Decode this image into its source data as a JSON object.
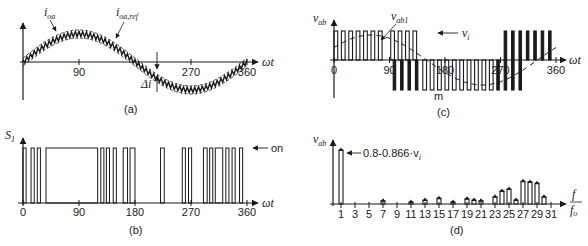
{
  "figure": {
    "panels": [
      {
        "id": "a",
        "caption": "(a)"
      },
      {
        "id": "b",
        "caption": "(b)"
      },
      {
        "id": "c",
        "caption": "(c)"
      },
      {
        "id": "d",
        "caption": "(d)"
      }
    ]
  },
  "chart_data": [
    {
      "panel": "a",
      "type": "line",
      "title": "",
      "caption": "(a)",
      "xlabel": "ωt",
      "ylabel": "",
      "xticks": [
        "90",
        "270",
        "360"
      ],
      "xtick_values": [
        90,
        270,
        360
      ],
      "xlim": [
        0,
        360
      ],
      "series": [
        {
          "name": "i_oa",
          "label_main": "i",
          "label_sub": "oa",
          "style": "solid-ripple",
          "description": "actual current with hysteresis ripple following sinusoidal reference"
        },
        {
          "name": "i_oa,ref",
          "label_main": "i",
          "label_sub": "oa,ref",
          "style": "dashed-band",
          "description": "sinusoidal reference with upper/lower hysteresis band"
        }
      ],
      "annotations": [
        {
          "text": "Δi",
          "meaning": "hysteresis band width",
          "at_deg": 215
        }
      ],
      "grid": false
    },
    {
      "panel": "b",
      "type": "line",
      "title": "",
      "caption": "(b)",
      "xlabel": "ωt",
      "ylabel": "S1",
      "ylabel_main": "S",
      "ylabel_sub": "1",
      "xticks": [
        "0",
        "90",
        "180",
        "270",
        "360"
      ],
      "xtick_values": [
        0,
        90,
        180,
        270,
        360
      ],
      "xlim": [
        0,
        360
      ],
      "level_label": "on",
      "on_intervals_deg": [
        [
          0,
          5
        ],
        [
          13,
          18
        ],
        [
          23,
          28
        ],
        [
          37,
          120
        ],
        [
          125,
          130
        ],
        [
          134,
          139
        ],
        [
          145,
          150
        ],
        [
          161,
          168
        ],
        [
          172,
          180
        ],
        [
          221,
          227
        ],
        [
          256,
          261
        ],
        [
          266,
          271
        ],
        [
          290,
          296
        ],
        [
          300,
          305
        ],
        [
          309,
          321
        ],
        [
          326,
          331
        ],
        [
          336,
          341
        ],
        [
          348,
          353
        ]
      ],
      "grid": false
    },
    {
      "panel": "c",
      "type": "line",
      "title": "",
      "caption": "(c)",
      "xlabel": "ωt",
      "ylabel": "v_ab",
      "ylabel_main": "v",
      "ylabel_sub": "ab",
      "xticks": [
        "0",
        "90",
        "180",
        "270",
        "360"
      ],
      "xtick_values": [
        0,
        90,
        180,
        270,
        360
      ],
      "xlim": [
        0,
        360
      ],
      "series": [
        {
          "name": "v_ab",
          "type": "pwm-pulses"
        },
        {
          "name": "v_ab1",
          "label_main": "v",
          "label_sub": "ab1",
          "type": "fundamental-dashed"
        }
      ],
      "annotations": [
        {
          "text": "← v_i",
          "label_main": "v",
          "label_sub": "i",
          "meaning": "dc link voltage level"
        },
        {
          "text": "m",
          "at_deg": 193
        }
      ],
      "pos_pulses_deg": [
        [
          0,
          6
        ],
        [
          12,
          18
        ],
        [
          24,
          30
        ],
        [
          36,
          42
        ],
        [
          48,
          54
        ],
        [
          60,
          66
        ],
        [
          72,
          78
        ],
        [
          92,
          98
        ],
        [
          104,
          110
        ],
        [
          116,
          122
        ],
        [
          128,
          134
        ],
        [
          276,
          280
        ],
        [
          288,
          292
        ],
        [
          300,
          304
        ],
        [
          312,
          316
        ],
        [
          324,
          328
        ],
        [
          336,
          340
        ],
        [
          348,
          352
        ]
      ],
      "neg_pulses_deg": [
        [
          96,
          100
        ],
        [
          108,
          112
        ],
        [
          120,
          124
        ],
        [
          132,
          136
        ],
        [
          144,
          150
        ],
        [
          156,
          162
        ],
        [
          168,
          174
        ],
        [
          180,
          186
        ],
        [
          192,
          198
        ],
        [
          204,
          210
        ],
        [
          216,
          222
        ],
        [
          228,
          234
        ],
        [
          240,
          246
        ],
        [
          252,
          258
        ],
        [
          264,
          268
        ],
        [
          276,
          280
        ],
        [
          288,
          292
        ],
        [
          300,
          304
        ]
      ],
      "grid": false
    },
    {
      "panel": "d",
      "type": "bar",
      "title": "",
      "caption": "(d)",
      "xlabel": "f/f_o",
      "xlabel_num": "f",
      "xlabel_den_main": "f",
      "xlabel_den_sub": "o",
      "ylabel": "v_ab",
      "ylabel_main": "v",
      "ylabel_sub": "ab",
      "xticks": [
        "1",
        "3",
        "5",
        "7",
        "9",
        "11",
        "13",
        "15",
        "17",
        "19",
        "21",
        "23",
        "25",
        "27",
        "29",
        "31"
      ],
      "annotation": "0.8-0.866·v_i",
      "annotation_main": "0.8-0.866·v",
      "annotation_sub": "i",
      "categories": [
        1,
        7,
        11,
        13,
        15,
        17,
        19,
        20,
        21,
        23,
        24,
        25,
        26,
        27,
        28,
        29,
        30
      ],
      "values": [
        0.83,
        0.05,
        0.03,
        0.06,
        0.09,
        0.03,
        0.08,
        0.06,
        0.05,
        0.11,
        0.2,
        0.23,
        0.06,
        0.35,
        0.34,
        0.32,
        0.11
      ],
      "ylim": [
        0,
        1
      ],
      "grid": false
    }
  ]
}
